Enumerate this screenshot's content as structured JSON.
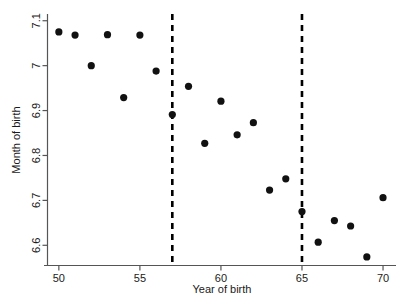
{
  "chart_data": {
    "type": "scatter",
    "title": "",
    "xlabel": "Year of birth",
    "ylabel": "Month of birth",
    "xlim": [
      49.3,
      70.8
    ],
    "ylim": [
      6.555,
      7.115
    ],
    "grid": false,
    "legend": "none",
    "x_ticks": [
      50,
      55,
      60,
      65,
      70
    ],
    "x_tick_labels": [
      "50",
      "55",
      "60",
      "65",
      "70"
    ],
    "y_ticks": [
      6.6,
      6.7,
      6.8,
      6.9,
      7.0,
      7.1
    ],
    "y_tick_labels": [
      "6.6",
      "6.7",
      "6.8",
      "6.9",
      "7",
      "7.1"
    ],
    "marker": "filled-circle",
    "marker_color": "#111111",
    "x": [
      50,
      51,
      52,
      53,
      54,
      55,
      56,
      57,
      58,
      59,
      60,
      61,
      62,
      63,
      64,
      65,
      66,
      67,
      68,
      69,
      70
    ],
    "y": [
      7.075,
      7.068,
      7.0,
      7.069,
      6.929,
      7.068,
      6.988,
      6.891,
      6.954,
      6.827,
      6.921,
      6.846,
      6.873,
      6.723,
      6.748,
      6.675,
      6.607,
      6.655,
      6.643,
      6.574,
      6.706
    ],
    "values": [
      {
        "x": 50,
        "y": 7.075
      },
      {
        "x": 51,
        "y": 7.068
      },
      {
        "x": 52,
        "y": 7.0
      },
      {
        "x": 53,
        "y": 7.069
      },
      {
        "x": 54,
        "y": 6.929
      },
      {
        "x": 55,
        "y": 7.068
      },
      {
        "x": 56,
        "y": 6.988
      },
      {
        "x": 57,
        "y": 6.891
      },
      {
        "x": 58,
        "y": 6.954
      },
      {
        "x": 59,
        "y": 6.827
      },
      {
        "x": 60,
        "y": 6.921
      },
      {
        "x": 61,
        "y": 6.846
      },
      {
        "x": 62,
        "y": 6.873
      },
      {
        "x": 63,
        "y": 6.723
      },
      {
        "x": 64,
        "y": 6.748
      },
      {
        "x": 65,
        "y": 6.675
      },
      {
        "x": 66,
        "y": 6.607
      },
      {
        "x": 67,
        "y": 6.655
      },
      {
        "x": 68,
        "y": 6.643
      },
      {
        "x": 69,
        "y": 6.574
      },
      {
        "x": 70,
        "y": 6.706
      }
    ],
    "annotations": [
      {
        "type": "vertical-dashed-line",
        "x": 57,
        "style": "dashed",
        "color": "#000000"
      },
      {
        "type": "vertical-dashed-line",
        "x": 65,
        "style": "dashed",
        "color": "#000000"
      }
    ]
  }
}
